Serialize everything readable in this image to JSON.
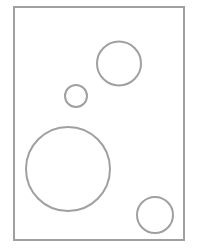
{
  "canvas": {
    "width": 198,
    "height": 250,
    "background": "#ffffff"
  },
  "frame": {
    "x": 14,
    "y": 7,
    "width": 170,
    "height": 233,
    "stroke": "#a0a0a0",
    "stroke_width": 2
  },
  "circles": [
    {
      "cx": 119,
      "cy": 63.5,
      "r": 22,
      "stroke": "#a0a0a0"
    },
    {
      "cx": 76,
      "cy": 96,
      "r": 11,
      "stroke": "#a0a0a0"
    },
    {
      "cx": 68,
      "cy": 169,
      "r": 42,
      "stroke": "#a0a0a0"
    },
    {
      "cx": 155,
      "cy": 215,
      "r": 18,
      "stroke": "#a0a0a0"
    }
  ]
}
